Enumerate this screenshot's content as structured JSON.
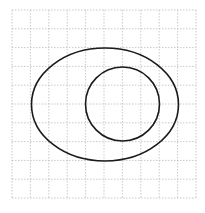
{
  "diagram": {
    "grid": {
      "columns": 10,
      "rows": 10,
      "x0": 12,
      "y0": 10,
      "x1": 196,
      "y1": 198,
      "line_color": "#bbbbbb",
      "dash": "1.5,1.5"
    },
    "shapes": [
      {
        "name": "outer-ellipse",
        "type": "ellipse",
        "cx": 105,
        "cy": 104.5,
        "rx": 73.5,
        "ry": 56.5,
        "stroke": "#1a1a1a",
        "stroke_width": 1.6
      },
      {
        "name": "inner-circle",
        "type": "circle",
        "cx": 122.5,
        "cy": 104,
        "r": 37,
        "stroke": "#1a1a1a",
        "stroke_width": 1.6
      }
    ]
  }
}
